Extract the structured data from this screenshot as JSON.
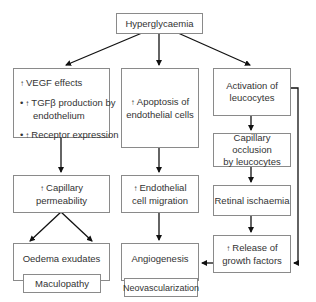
{
  "diagram": {
    "root": {
      "label": "Hyperglycaemia"
    },
    "up_arrow_glyph": "↑",
    "bullet_glyph": "•",
    "left_column": {
      "box1": {
        "items": [
          {
            "bullet": false,
            "text": "VEGF effects"
          },
          {
            "bullet": true,
            "text": "TGFβ production by",
            "cont": "endothelium"
          },
          {
            "bullet": true,
            "text": "Receptor expression"
          }
        ]
      },
      "box2": {
        "line1": "Capillary",
        "line2": "permeability",
        "up": true
      },
      "box3": {
        "label": "Oedema exudates"
      },
      "outcome": {
        "label": "Maculopathy"
      }
    },
    "middle_column": {
      "box1": {
        "line1": "Apoptosis of",
        "line2": "endothelial cells",
        "up": true
      },
      "box2": {
        "line1": "Endothelial",
        "line2": "cell migration",
        "up": true
      },
      "box3": {
        "label": "Angiogenesis"
      },
      "outcome": {
        "label": "Neovascularization"
      }
    },
    "right_column": {
      "box1": {
        "line1": "Activation of",
        "line2": "leucocytes"
      },
      "box2": {
        "line1": "Capillary occlusion",
        "line2": "by leucocytes"
      },
      "box3": {
        "label": "Retinal ischaemia"
      },
      "box4": {
        "line1": "Release of",
        "line2": "growth factors",
        "up": true
      }
    },
    "colors": {
      "border": "#8a8a8a",
      "arrow": "#111111",
      "text": "#333333"
    }
  }
}
